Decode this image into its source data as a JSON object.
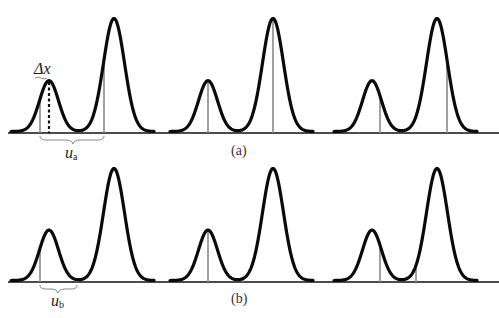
{
  "figure": {
    "panels": [
      {
        "id": "a",
        "caption": "(a)",
        "offset_label": "u",
        "offset_sub": "a",
        "delta_label": "Δx",
        "groups": [
          {
            "small_peak_center": 49,
            "tall_peak_center": 114,
            "markers": [
              40,
              104
            ]
          },
          {
            "small_peak_center": 208,
            "tall_peak_center": 273,
            "markers": [
              208,
              273
            ]
          },
          {
            "small_peak_center": 372,
            "tall_peak_center": 437,
            "markers": [
              380,
              447
            ]
          }
        ]
      },
      {
        "id": "b",
        "caption": "(b)",
        "offset_label": "u",
        "offset_sub": "b",
        "groups": [
          {
            "small_peak_center": 49,
            "tall_peak_center": 114,
            "markers": [
              40,
              77
            ]
          },
          {
            "small_peak_center": 208,
            "tall_peak_center": 273,
            "markers": [
              208,
              243
            ]
          },
          {
            "small_peak_center": 372,
            "tall_peak_center": 437,
            "markers": [
              380,
              416
            ]
          }
        ]
      }
    ],
    "peak_ratio": {
      "small": 0.45,
      "tall": 1.0
    }
  }
}
